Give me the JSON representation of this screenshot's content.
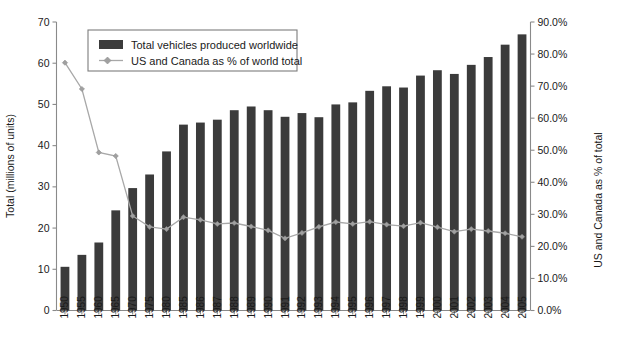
{
  "chart_data": {
    "type": "bar",
    "title": "",
    "subtitle": "",
    "xlabel": "",
    "ylabel": "Total (millions of units)",
    "y2label": "US and Canada as % of total",
    "grid": false,
    "legend_position": "top-left-inside",
    "ylim": [
      0,
      70
    ],
    "y2lim": [
      0,
      0.9
    ],
    "yticks": [
      "0",
      "10",
      "20",
      "30",
      "40",
      "50",
      "60",
      "70"
    ],
    "ytick_values": [
      0,
      10,
      20,
      30,
      40,
      50,
      60,
      70
    ],
    "y2ticks": [
      "0.0%",
      "10.0%",
      "20.0%",
      "30.0%",
      "40.0%",
      "50.0%",
      "60.0%",
      "70.0%",
      "80.0%",
      "90.0%"
    ],
    "y2tick_values": [
      0,
      10,
      20,
      30,
      40,
      50,
      60,
      70,
      80,
      90
    ],
    "categories": [
      "1950",
      "1955",
      "1960",
      "1965",
      "1970",
      "1975",
      "1980",
      "1985",
      "1986",
      "1987",
      "1988",
      "1989",
      "1990",
      "1991",
      "1992",
      "1993",
      "1994",
      "1995",
      "1996",
      "1997",
      "1998",
      "1999",
      "2000",
      "2001",
      "2002",
      "2003",
      "2004",
      "2005"
    ],
    "series": [
      {
        "name": "Total vehicles produced worldwide",
        "type": "bar",
        "axis": "left",
        "color": "#3b3b3b",
        "values": [
          10.6,
          13.5,
          16.5,
          24.3,
          29.7,
          33.0,
          38.6,
          45.1,
          45.6,
          46.3,
          48.6,
          49.5,
          48.6,
          47.0,
          47.9,
          46.9,
          50.0,
          50.5,
          53.3,
          54.4,
          54.1,
          57.0,
          58.3,
          57.4,
          59.6,
          61.5,
          64.5,
          67.0
        ]
      },
      {
        "name": "US and Canada as % of world total",
        "type": "line",
        "axis": "right",
        "color": "#a8a8a8",
        "values": [
          77.3,
          69.1,
          49.3,
          48.2,
          29.5,
          26.1,
          25.4,
          29.1,
          28.3,
          27.0,
          27.3,
          26.2,
          25.0,
          22.5,
          24.2,
          26.1,
          27.6,
          27.0,
          27.7,
          26.8,
          26.3,
          27.4,
          26.0,
          24.6,
          25.4,
          24.8,
          24.1,
          23.0
        ]
      }
    ]
  },
  "legend": {
    "entries": [
      {
        "label": "Total vehicles produced worldwide",
        "marker": "swatch"
      },
      {
        "label": "US and Canada as % of world total",
        "marker": "line"
      }
    ]
  },
  "axes": {
    "left_title": "Total (millions of units)",
    "right_title": "US and Canada as % of total"
  },
  "colors": {
    "bar": "#3b3b3b",
    "line": "#a8a8a8",
    "axis": "#8a8a8a",
    "text": "#1a1a1a",
    "background": "#ffffff"
  }
}
